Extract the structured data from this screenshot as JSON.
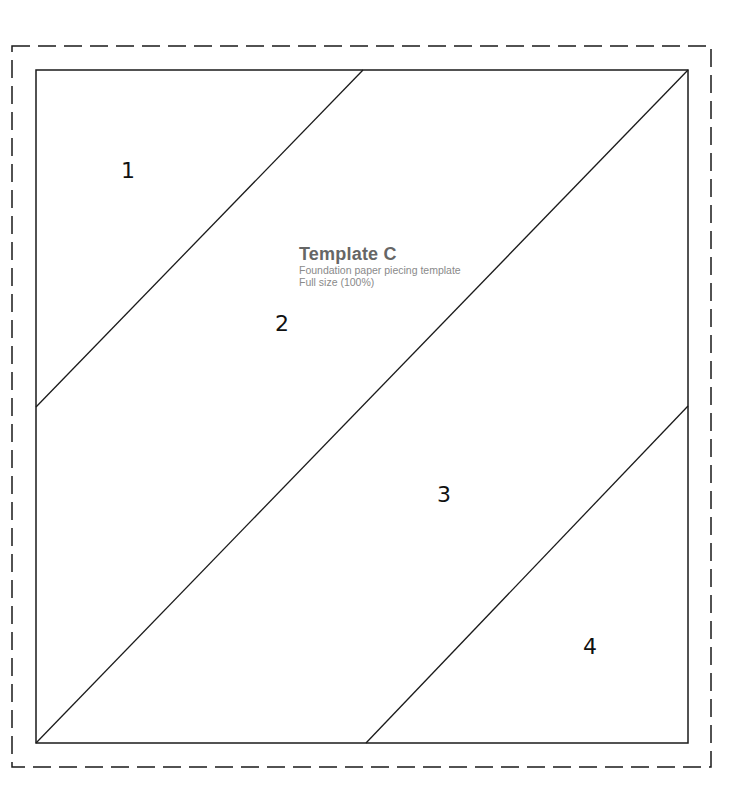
{
  "template": {
    "title": "Template C",
    "subtitle": "Foundation paper piecing template",
    "scale_note": "Full size (100%)"
  },
  "sections": [
    {
      "label": "1",
      "x": 121,
      "y": 160
    },
    {
      "label": "2",
      "x": 275,
      "y": 313
    },
    {
      "label": "3",
      "x": 437,
      "y": 484
    },
    {
      "label": "4",
      "x": 583,
      "y": 636
    }
  ],
  "geometry": {
    "seam_allowance_border": {
      "x1": 12,
      "y1": 46,
      "x2": 711,
      "y2": 767,
      "style": "dashed"
    },
    "block_outline": {
      "x1": 36,
      "y1": 70,
      "x2": 688,
      "y2": 743
    },
    "piecing_lines": [
      {
        "x1": 363,
        "y1": 70,
        "x2": 36,
        "y2": 407
      },
      {
        "x1": 688,
        "y1": 70,
        "x2": 36,
        "y2": 743
      },
      {
        "x1": 688,
        "y1": 406,
        "x2": 366,
        "y2": 743
      }
    ]
  },
  "colors": {
    "line": "#1a1a1a",
    "title": "#666666",
    "subtitle": "#8a8a8a"
  }
}
